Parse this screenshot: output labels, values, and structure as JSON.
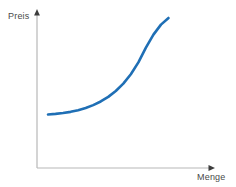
{
  "chart_data": {
    "type": "line",
    "title": "",
    "subtitle": "",
    "xlabel": "Menge",
    "ylabel": "Preis",
    "legend": [],
    "grid": false,
    "axis_style": "arrow-axes",
    "axis_color": "#b8b8b8",
    "arrow_color": "#3d3d3d",
    "label_color": "#4a4a4a",
    "background": "#ffffff",
    "xlim": [
      0,
      10
    ],
    "ylim": [
      0,
      10
    ],
    "series": [
      {
        "name": "Angebotskurve",
        "color": "#1f6fb5",
        "line_width": 2.6,
        "x": [
          0.0,
          0.5,
          1.0,
          1.5,
          2.0,
          2.5,
          3.0,
          3.5,
          4.0,
          4.5,
          5.0,
          5.5,
          6.0,
          6.5,
          7.0,
          7.5,
          8.0
        ],
        "values": [
          1.0,
          1.05,
          1.12,
          1.22,
          1.36,
          1.54,
          1.78,
          2.08,
          2.46,
          2.95,
          3.56,
          4.34,
          5.32,
          6.55,
          7.62,
          8.45,
          9.0
        ]
      }
    ],
    "annotations": []
  },
  "labels": {
    "y_axis": "Preis",
    "x_axis": "Menge"
  },
  "icons": {
    "y_arrow": "arrow-up-icon",
    "x_arrow": "arrow-right-icon"
  }
}
